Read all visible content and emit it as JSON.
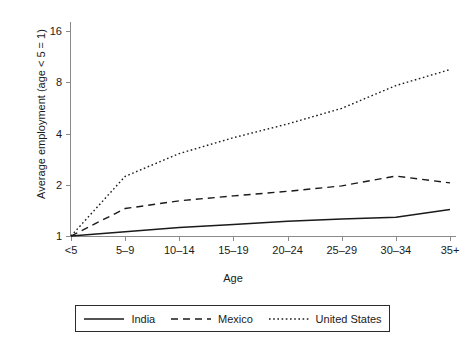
{
  "chart_data": {
    "type": "line",
    "title": "",
    "xlabel": "Age",
    "ylabel": "Average employment (age < 5 = 1)",
    "categories": [
      "<5",
      "5–9",
      "10–14",
      "15–19",
      "20–24",
      "25–29",
      "30–34",
      "35+"
    ],
    "y_scale": "log2",
    "ylim": [
      0.85,
      20
    ],
    "yticks": [
      1,
      2,
      4,
      8,
      16
    ],
    "ytick_labels": [
      "1",
      "2",
      "4",
      "8",
      "16"
    ],
    "grid": false,
    "legend_position": "bottom",
    "series": [
      {
        "name": "India",
        "style": "solid",
        "color": "#1a1a1a",
        "values": [
          1.0,
          1.06,
          1.12,
          1.17,
          1.22,
          1.26,
          1.29,
          1.43
        ]
      },
      {
        "name": "Mexico",
        "style": "dashed",
        "color": "#1a1a1a",
        "values": [
          1.0,
          1.45,
          1.61,
          1.72,
          1.83,
          1.97,
          2.25,
          2.05
        ]
      },
      {
        "name": "United States",
        "style": "dotted",
        "color": "#1a1a1a",
        "values": [
          1.0,
          2.24,
          3.05,
          3.78,
          4.55,
          5.62,
          7.65,
          9.5
        ]
      }
    ]
  },
  "legend": {
    "items": [
      {
        "label": "India",
        "style": "solid"
      },
      {
        "label": "Mexico",
        "style": "dashed"
      },
      {
        "label": "United States",
        "style": "dotted"
      }
    ]
  }
}
